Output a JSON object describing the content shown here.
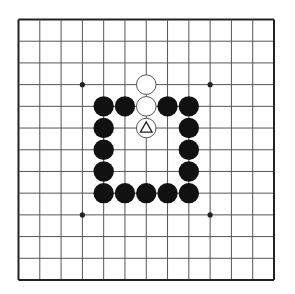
{
  "board": {
    "size": 13,
    "star_points": [
      [
        3,
        3
      ],
      [
        9,
        3
      ],
      [
        3,
        9
      ],
      [
        9,
        9
      ]
    ],
    "colors": {
      "background": "#ffffff",
      "grid_line": "#555555",
      "border": "#222222",
      "black_stone": "#111111",
      "white_stone_fill": "#ffffff",
      "white_stone_stroke": "#444444",
      "marker": "#222222"
    },
    "stones": [
      {
        "color": "white",
        "col": 6,
        "row": 3
      },
      {
        "color": "white",
        "col": 6,
        "row": 4
      },
      {
        "color": "black",
        "col": 4,
        "row": 4
      },
      {
        "color": "black",
        "col": 5,
        "row": 4
      },
      {
        "color": "black",
        "col": 7,
        "row": 4
      },
      {
        "color": "black",
        "col": 8,
        "row": 4
      },
      {
        "color": "white",
        "col": 6,
        "row": 5,
        "marker": "triangle"
      },
      {
        "color": "black",
        "col": 4,
        "row": 5
      },
      {
        "color": "black",
        "col": 8,
        "row": 5
      },
      {
        "color": "black",
        "col": 4,
        "row": 6
      },
      {
        "color": "black",
        "col": 8,
        "row": 6
      },
      {
        "color": "black",
        "col": 4,
        "row": 7
      },
      {
        "color": "black",
        "col": 8,
        "row": 7
      },
      {
        "color": "black",
        "col": 4,
        "row": 8
      },
      {
        "color": "black",
        "col": 5,
        "row": 8
      },
      {
        "color": "black",
        "col": 6,
        "row": 8
      },
      {
        "color": "black",
        "col": 7,
        "row": 8
      },
      {
        "color": "black",
        "col": 8,
        "row": 8
      }
    ]
  }
}
